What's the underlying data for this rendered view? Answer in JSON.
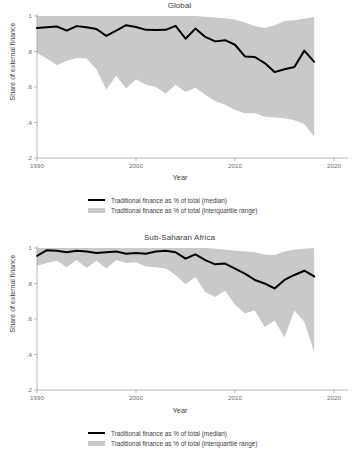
{
  "figure": {
    "width": 359,
    "height": 465,
    "background": "#ffffff",
    "line_color": "#000000",
    "band_color": "#c9c9c9",
    "axis_color": "#9b9b9b",
    "text_color": "#3d3d3d"
  },
  "legend": {
    "median_label": "Traditional finance as % of total (median)",
    "range_label": "Traditional finance as % of total (interquartile range)"
  },
  "chart_data": [
    {
      "type": "line",
      "title": "Global",
      "xlabel": "Year",
      "ylabel": "Share of external finance",
      "xlim": [
        1990,
        2020
      ],
      "ylim": [
        0.2,
        1.0
      ],
      "xticks": [
        1990,
        2000,
        2010,
        2020
      ],
      "xticklabels": [
        "1990",
        "2000",
        "2010",
        "2020"
      ],
      "yticks": [
        0.2,
        0.4,
        0.6,
        0.8,
        1.0
      ],
      "yticklabels": [
        ".2",
        ".4",
        ".6",
        ".8",
        "1"
      ],
      "grid": false,
      "legend_position": "below",
      "x": [
        1990,
        1991,
        1992,
        1993,
        1994,
        1995,
        1996,
        1997,
        1998,
        1999,
        2000,
        2001,
        2002,
        2003,
        2004,
        2005,
        2006,
        2007,
        2008,
        2009,
        2010,
        2011,
        2012,
        2013,
        2014,
        2015,
        2016,
        2017,
        2018
      ],
      "series": [
        {
          "name": "Traditional finance as % of total (median)",
          "values": [
            0.932,
            0.936,
            0.941,
            0.918,
            0.943,
            0.936,
            0.927,
            0.888,
            0.918,
            0.948,
            0.938,
            0.922,
            0.921,
            0.922,
            0.944,
            0.872,
            0.929,
            0.882,
            0.857,
            0.864,
            0.838,
            0.772,
            0.769,
            0.735,
            0.684,
            0.7,
            0.713,
            0.805,
            0.742,
            0.757
          ]
        }
      ],
      "band": {
        "name": "Traditional finance as % of total (interquartile range)",
        "upper": [
          1.0,
          1.0,
          1.0,
          1.0,
          1.0,
          1.0,
          1.0,
          1.0,
          1.0,
          1.0,
          1.0,
          1.0,
          1.0,
          1.0,
          1.0,
          1.0,
          1.0,
          0.996,
          0.992,
          0.988,
          0.98,
          0.964,
          0.944,
          0.932,
          0.948,
          0.972,
          0.976,
          0.984,
          0.996
        ],
        "lower": [
          0.792,
          0.76,
          0.722,
          0.748,
          0.764,
          0.76,
          0.7,
          0.586,
          0.664,
          0.592,
          0.644,
          0.612,
          0.6,
          0.564,
          0.612,
          0.572,
          0.596,
          0.556,
          0.52,
          0.5,
          0.47,
          0.452,
          0.452,
          0.432,
          0.428,
          0.424,
          0.412,
          0.392,
          0.32
        ]
      }
    },
    {
      "type": "line",
      "title": "Sub-Saharan Africa",
      "xlabel": "Year",
      "ylabel": "Share of external finance",
      "xlim": [
        1990,
        2020
      ],
      "ylim": [
        0.2,
        1.0
      ],
      "xticks": [
        1990,
        2000,
        2010,
        2020
      ],
      "xticklabels": [
        "1990",
        "2000",
        "2010",
        "2020"
      ],
      "yticks": [
        0.2,
        0.4,
        0.6,
        0.8,
        1.0
      ],
      "yticklabels": [
        ".2",
        ".4",
        ".6",
        ".8",
        "1"
      ],
      "grid": false,
      "legend_position": "below",
      "x": [
        1990,
        1991,
        1992,
        1993,
        1994,
        1995,
        1996,
        1997,
        1998,
        1999,
        2000,
        2001,
        2002,
        2003,
        2004,
        2005,
        2006,
        2007,
        2008,
        2009,
        2010,
        2011,
        2012,
        2013,
        2014,
        2015,
        2016,
        2017,
        2018
      ],
      "series": [
        {
          "name": "Traditional finance as % of total (median)",
          "values": [
            0.956,
            0.988,
            0.984,
            0.976,
            0.984,
            0.98,
            0.972,
            0.976,
            0.98,
            0.968,
            0.972,
            0.968,
            0.98,
            0.984,
            0.976,
            0.94,
            0.964,
            0.932,
            0.908,
            0.912,
            0.884,
            0.856,
            0.82,
            0.8,
            0.772,
            0.82,
            0.848,
            0.872,
            0.84,
            0.812
          ]
        }
      ],
      "band": {
        "name": "Traditional finance as % of total (interquartile range)",
        "upper": [
          1.0,
          1.0,
          1.0,
          1.0,
          1.0,
          1.0,
          1.0,
          1.0,
          1.0,
          1.0,
          1.0,
          1.0,
          1.0,
          1.0,
          1.0,
          1.0,
          1.0,
          1.0,
          0.996,
          0.992,
          0.984,
          0.98,
          0.976,
          0.964,
          0.96,
          0.98,
          0.992,
          0.996,
          1.0
        ],
        "lower": [
          0.9,
          0.916,
          0.928,
          0.892,
          0.932,
          0.888,
          0.928,
          0.884,
          0.932,
          0.916,
          0.92,
          0.896,
          0.892,
          0.884,
          0.848,
          0.796,
          0.836,
          0.752,
          0.724,
          0.76,
          0.68,
          0.632,
          0.648,
          0.556,
          0.592,
          0.496,
          0.648,
          0.584,
          0.412
        ]
      }
    }
  ]
}
